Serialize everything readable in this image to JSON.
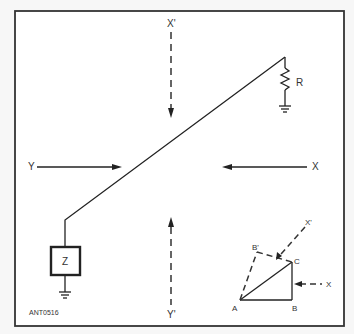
{
  "figure_id": "ANT0516",
  "labels": {
    "resistor": "R",
    "impedance": "Z",
    "wave_x_prime_top": "X'",
    "wave_y_prime_bottom": "Y'",
    "wave_y_left": "Y",
    "wave_x_right": "X",
    "inset_x_prime": "X'",
    "inset_x": "X",
    "vertex_a": "A",
    "vertex_b": "B",
    "vertex_c": "C",
    "vertex_b_prime": "B'"
  },
  "colors": {
    "line": "#222222",
    "background": "#ffffff"
  }
}
